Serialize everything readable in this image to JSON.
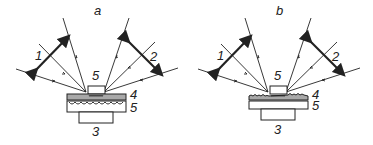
{
  "figure": {
    "panels": [
      {
        "id": "a",
        "title": "a",
        "labels": {
          "beam1": "1",
          "beam2": "2",
          "chip": "5",
          "layer_top": "4",
          "layer_bottom": "5",
          "base": "3"
        },
        "layer4_style": "smooth"
      },
      {
        "id": "b",
        "title": "b",
        "labels": {
          "beam1": "1",
          "beam2": "2",
          "chip": "5",
          "layer_top": "4",
          "layer_bottom": "5",
          "base": "3"
        },
        "layer4_style": "rough"
      }
    ],
    "colors": {
      "line": "#222222",
      "layer4_fill": "#a8a8a8",
      "background": "#ffffff"
    }
  }
}
